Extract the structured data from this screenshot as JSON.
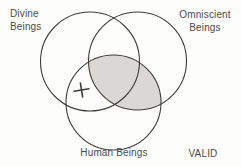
{
  "diagram": {
    "type": "venn-diagram-syllogism-test",
    "labels": {
      "divine": "Divine\nBeings",
      "omniscient": "Omniscient\nBeings",
      "human": "Human Beings"
    },
    "verdict": "VALID",
    "mark": {
      "glyph": "+",
      "region": "Divine and Human, outside Omniscient"
    },
    "shaded_region": "Omniscient and Human (entire overlap)",
    "colors": {
      "shade": "#d9d8d5",
      "stroke": "#3d3c3a",
      "text": "#4c4b49",
      "background": "#fdfdfc"
    }
  }
}
